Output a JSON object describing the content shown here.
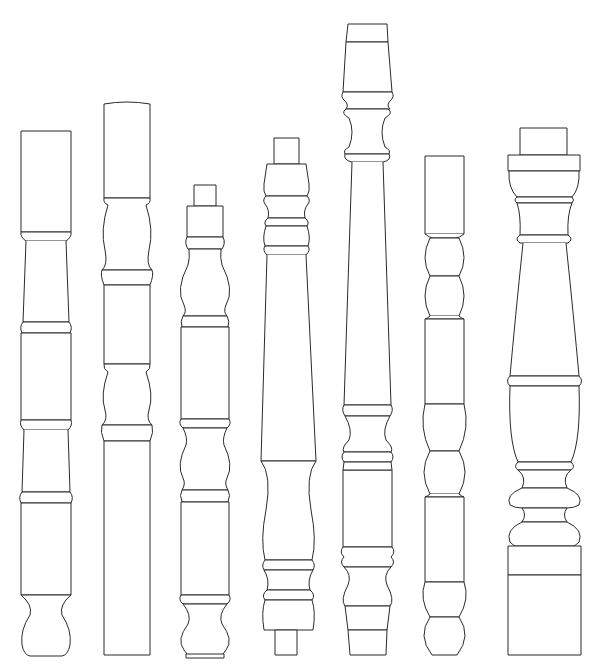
{
  "figure": {
    "title": "Seven turned balusters",
    "width": 601,
    "height": 669,
    "stroke": "#2a2a2a",
    "background": "#ffffff"
  },
  "balusters": [
    {
      "name": "baluster-1",
      "shapes": [
        {
          "t": "rect",
          "x": 21,
          "y": 131,
          "w": 50,
          "h": 101
        },
        {
          "t": "path",
          "d": "M21,232 Q20,237 26,241 L66,241 Q72,237 71,232 Z"
        },
        {
          "t": "path",
          "d": "M26,241 L23,322 L69,322 L66,241"
        },
        {
          "t": "path",
          "d": "M23,322 Q19,327 22,333 L70,333 Q73,327 69,322 Z"
        },
        {
          "t": "rect",
          "x": 21,
          "y": 333,
          "w": 50,
          "h": 87
        },
        {
          "t": "path",
          "d": "M21,420 Q19,425 24,430 L68,430 Q73,425 71,420 Z"
        },
        {
          "t": "path",
          "d": "M24,430 L22,492 L70,492 L68,430"
        },
        {
          "t": "path",
          "d": "M22,492 Q18,497 21,503 L71,503 Q74,497 70,492 Z"
        },
        {
          "t": "rect",
          "x": 21,
          "y": 503,
          "w": 50,
          "h": 92
        },
        {
          "t": "path",
          "d": "M21,595 Q33,605 30,615 Q20,630 22,645 Q24,655 30,656 L62,656 Q68,655 70,645 Q72,630 62,615 Q59,605 71,595 Z"
        }
      ]
    },
    {
      "name": "baluster-2",
      "shapes": [
        {
          "t": "path",
          "d": "M104,104 Q127,100 150,104 L150,198 L104,198 Z"
        },
        {
          "t": "path",
          "d": "M104,198 Q103,203 108,205 Q100,230 105,250 Q108,265 102,270 L152,270 Q146,265 149,250 Q154,230 146,205 Q151,203 150,198 Z"
        },
        {
          "t": "path",
          "d": "M102,270 Q100,275 104,285 L150,285 Q154,275 152,270 Z"
        },
        {
          "t": "rect",
          "x": 104,
          "y": 285,
          "w": 46,
          "h": 79
        },
        {
          "t": "path",
          "d": "M104,364 Q103,369 108,372 Q100,395 105,410 Q108,420 102,425 L152,425 Q146,420 149,410 Q154,395 146,372 Q151,369 150,364 Z"
        },
        {
          "t": "path",
          "d": "M102,425 Q100,432 104,441 L150,441 Q154,432 152,425 Z"
        },
        {
          "t": "rect",
          "x": 104,
          "y": 441,
          "w": 46,
          "h": 214
        }
      ]
    },
    {
      "name": "baluster-3",
      "shapes": [
        {
          "t": "rect",
          "x": 194,
          "y": 185,
          "w": 22,
          "h": 21
        },
        {
          "t": "rect",
          "x": 187,
          "y": 206,
          "w": 36,
          "h": 31
        },
        {
          "t": "path",
          "d": "M187,237 Q184,243 188,249 L222,249 Q226,243 223,237 Z"
        },
        {
          "t": "path",
          "d": "M189,249 Q190,258 188,265 Q175,290 184,305 Q187,312 183,316 L227,316 Q223,312 226,305 Q235,290 222,265 Q220,258 221,249 Z"
        },
        {
          "t": "path",
          "d": "M183,316 Q180,321 182,327 L228,327 Q230,321 227,316 Z"
        },
        {
          "t": "rect",
          "x": 181,
          "y": 327,
          "w": 48,
          "h": 92
        },
        {
          "t": "path",
          "d": "M181,419 Q178,424 183,428 L227,428 Q232,424 229,419 Z"
        },
        {
          "t": "path",
          "d": "M183,428 Q188,438 186,445 Q176,465 183,478 Q186,484 182,490 L228,490 Q224,484 227,478 Q234,465 224,445 Q222,438 227,428 Z"
        },
        {
          "t": "path",
          "d": "M182,490 Q179,495 182,502 L228,502 Q231,495 228,490 Z"
        },
        {
          "t": "rect",
          "x": 181,
          "y": 502,
          "w": 48,
          "h": 93
        },
        {
          "t": "path",
          "d": "M181,595 Q178,600 183,604 L227,604 Q232,600 229,595 Z"
        },
        {
          "t": "path",
          "d": "M183,604 Q192,615 188,624 Q176,640 184,650 Q188,655 188,656 L222,656 Q222,655 226,650 Q234,640 222,624 Q218,615 227,604 Z"
        },
        {
          "t": "rect",
          "x": 186,
          "y": 654,
          "w": 38,
          "h": 4
        }
      ]
    },
    {
      "name": "baluster-4",
      "shapes": [
        {
          "t": "rect",
          "x": 274,
          "y": 138,
          "w": 25,
          "h": 26
        },
        {
          "t": "path",
          "d": "M267,164 L306,164 L309,184 Q310,192 307,196 L266,196 Q263,192 264,184 Z"
        },
        {
          "t": "path",
          "d": "M266,196 Q262,200 265,204 Q270,210 268,218 L305,218 Q303,210 308,204 Q311,200 307,196 Z"
        },
        {
          "t": "path",
          "d": "M268,218 Q263,222 266,226 L307,226 Q310,222 305,218 Z"
        },
        {
          "t": "path",
          "d": "M266,226 Q262,238 265,246 L308,246 Q311,238 307,226 Z"
        },
        {
          "t": "path",
          "d": "M265,246 Q262,250 267,255 L306,255 Q311,250 308,246 Z"
        },
        {
          "t": "path",
          "d": "M267,255 L261,461 L316,461 L306,255"
        },
        {
          "t": "path",
          "d": "M261,461 Q272,475 266,510 Q260,540 265,560 L312,560 Q317,540 311,510 Q305,475 316,461 Z"
        },
        {
          "t": "path",
          "d": "M265,560 Q261,565 264,570 L313,570 Q316,565 312,560 Z"
        },
        {
          "t": "path",
          "d": "M264,570 Q270,580 267,590 L310,590 Q307,580 313,570 Z"
        },
        {
          "t": "path",
          "d": "M267,590 Q261,595 265,600 L312,600 Q316,595 310,590 Z"
        },
        {
          "t": "path",
          "d": "M265,600 Q261,612 264,630 L275,630 L302,630 L313,630 Q316,612 312,600 Z"
        },
        {
          "t": "rect",
          "x": 275,
          "y": 630,
          "w": 22,
          "h": 25
        }
      ]
    },
    {
      "name": "baluster-5",
      "shapes": [
        {
          "t": "path",
          "d": "M348,24 L387,24 L388,42 L346,42 Z"
        },
        {
          "t": "path",
          "d": "M346,42 L388,42 L392,92 L343,92 Z"
        },
        {
          "t": "path",
          "d": "M343,92 Q340,97 345,101 Q349,105 346,109 L390,109 Q386,105 390,101 Q395,97 392,92 Z"
        },
        {
          "t": "path",
          "d": "M346,109 Q340,113 349,118 Q355,132 349,147 Q343,150 345,154 L389,154 Q391,150 385,147 Q379,132 385,118 Q394,113 388,109 Z"
        },
        {
          "t": "path",
          "d": "M345,154 Q343,160 352,162 L383,162 Q392,160 389,154 Z"
        },
        {
          "t": "path",
          "d": "M352,162 L344,405 L391,405 L383,162"
        },
        {
          "t": "path",
          "d": "M344,405 L391,405 Q394,410 390,416 L345,416 Q341,410 344,405 Z"
        },
        {
          "t": "path",
          "d": "M345,416 Q353,430 349,440 Q341,448 344,452 L391,452 Q394,448 386,440 Q382,430 390,416 Z"
        },
        {
          "t": "path",
          "d": "M344,452 Q340,457 344,462 L391,462 Q395,457 391,452 Z"
        },
        {
          "t": "rect",
          "x": 343,
          "y": 470,
          "w": 49,
          "h": 77
        },
        {
          "t": "path",
          "d": "M344,462 L391,462 L392,470 L343,470 Z"
        },
        {
          "t": "path",
          "d": "M343,547 Q339,552 344,557 Q339,562 344,567 L391,567 Q396,562 391,557 Q396,552 392,547 Z"
        },
        {
          "t": "path",
          "d": "M344,567 Q352,575 348,585 Q340,600 345,606 L390,606 Q395,600 387,585 Q383,575 391,567 Z"
        },
        {
          "t": "path",
          "d": "M345,606 L390,606 L387,630 L348,630 Z"
        },
        {
          "t": "path",
          "d": "M348,630 L387,630 L386,655 L350,655 Z"
        }
      ]
    },
    {
      "name": "baluster-6",
      "shapes": [
        {
          "t": "rect",
          "x": 425,
          "y": 156,
          "w": 39,
          "h": 78
        },
        {
          "t": "path",
          "d": "M425,234 Q430,238 433,238 L456,238 Q459,238 464,234"
        },
        {
          "t": "path",
          "d": "M430,238 Q420,258 430,276 L459,276 Q469,258 459,238 Z"
        },
        {
          "t": "path",
          "d": "M430,276 Q420,296 430,316 L459,316 Q469,296 459,276 Z"
        },
        {
          "t": "path",
          "d": "M430,316 Q428,318 425,319 L464,319 Q461,318 459,316"
        },
        {
          "t": "rect",
          "x": 425,
          "y": 319,
          "w": 39,
          "h": 85
        },
        {
          "t": "path",
          "d": "M425,404 Q419,428 430,451 L459,451 Q470,428 464,404 Z"
        },
        {
          "t": "path",
          "d": "M430,451 Q418,472 430,494 L459,494 Q471,472 459,451 Z"
        },
        {
          "t": "path",
          "d": "M430,494 Q428,496 425,497 L464,497 Q461,496 459,494"
        },
        {
          "t": "rect",
          "x": 425,
          "y": 497,
          "w": 39,
          "h": 85
        },
        {
          "t": "path",
          "d": "M425,582 Q419,599 430,617 L459,617 Q470,599 464,582 Z"
        },
        {
          "t": "path",
          "d": "M430,617 Q417,636 432,655 L457,655 Q472,636 459,617 Z"
        }
      ]
    },
    {
      "name": "baluster-7",
      "shapes": [
        {
          "t": "rect",
          "x": 520,
          "y": 128,
          "w": 47,
          "h": 27
        },
        {
          "t": "rect",
          "x": 508,
          "y": 155,
          "w": 72,
          "h": 16
        },
        {
          "t": "path",
          "d": "M509,171 Q508,188 517,197 L572,197 Q580,188 579,171 Z"
        },
        {
          "t": "path",
          "d": "M517,197 Q513,200 517,203 L572,203 Q575,200 572,197 Z"
        },
        {
          "t": "path",
          "d": "M517,203 Q521,215 520,235 L568,235 Q567,215 572,203 Z"
        },
        {
          "t": "path",
          "d": "M520,235 Q514,239 520,243 L568,243 Q574,239 568,235 Z"
        },
        {
          "t": "path",
          "d": "M523,243 Q515,320 510,376 L579,376 Q574,320 566,243"
        },
        {
          "t": "path",
          "d": "M510,376 Q505,381 510,386 L579,386 Q584,381 579,376 Z"
        },
        {
          "t": "path",
          "d": "M510,386 Q508,440 518,462 L571,462 Q581,440 579,386 Z"
        },
        {
          "t": "path",
          "d": "M518,462 Q513,467 518,470 L571,470 Q576,467 571,462 Z"
        },
        {
          "t": "path",
          "d": "M518,470 Q527,477 522,488 L567,488 Q562,477 571,470 Z"
        },
        {
          "t": "path",
          "d": "M522,488 Q505,495 510,505 Q515,508 522,508 L567,508 Q574,508 579,505 Q584,495 567,488 Z"
        },
        {
          "t": "path",
          "d": "M522,508 Q527,515 522,522 L567,522 Q562,515 567,508 Z"
        },
        {
          "t": "path",
          "d": "M522,522 Q505,530 510,542 Q513,545 515,546 L574,546 Q576,545 579,542 Q584,530 567,522 Z"
        },
        {
          "t": "rect",
          "x": 508,
          "y": 546,
          "w": 73,
          "h": 29
        },
        {
          "t": "rect",
          "x": 508,
          "y": 575,
          "w": 73,
          "h": 80
        }
      ]
    }
  ]
}
